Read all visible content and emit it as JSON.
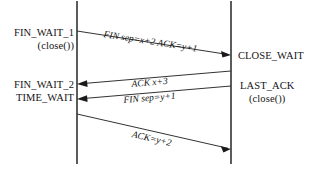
{
  "diagram": {
    "type": "sequence-diagram",
    "background_color": "#ffffff",
    "line_color": "#333333",
    "text_color": "#141414",
    "lifelines": [
      {
        "id": "client",
        "x": 77,
        "y_top": 1,
        "y_bottom": 164
      },
      {
        "id": "server",
        "x": 231,
        "y_top": 1,
        "y_bottom": 164
      }
    ],
    "left_states": [
      {
        "name": "FIN_WAIT_1",
        "sub": "(close())",
        "x_right": 74,
        "y": 27
      },
      {
        "name": "FIN_WAIT_2",
        "sub": "",
        "x_right": 74,
        "y": 79
      },
      {
        "name": "TIME_WAIT",
        "sub": "",
        "x_right": 74,
        "y": 92
      }
    ],
    "right_states": [
      {
        "name": "CLOSE_WAIT",
        "sub": "",
        "x_left": 238,
        "y": 50
      },
      {
        "name": "LAST_ACK",
        "sub": "(close())",
        "x_left": 238,
        "y": 80
      }
    ],
    "messages": [
      {
        "label": "FIN sep=x+2 ACK=y+1",
        "direction": "left-to-right",
        "x1": 77,
        "y1": 31,
        "x2": 231,
        "y2": 55,
        "label_x": 103,
        "label_y": 29,
        "label_rotate": 8.9
      },
      {
        "label": "ACK x+3",
        "direction": "right-to-left",
        "x1": 231,
        "y1": 71,
        "x2": 77,
        "y2": 84,
        "label_x": 132,
        "label_y": 79,
        "label_rotate": -4.8
      },
      {
        "label": "FIN sep=y+1",
        "direction": "right-to-left",
        "x1": 231,
        "y1": 86,
        "x2": 77,
        "y2": 99,
        "label_x": 124,
        "label_y": 95,
        "label_rotate": -4.8
      },
      {
        "label": "ACK=y+2",
        "direction": "left-to-right",
        "x1": 77,
        "y1": 114,
        "x2": 231,
        "y2": 149,
        "label_x": 131,
        "label_y": 129,
        "label_rotate": 12.8
      }
    ]
  }
}
